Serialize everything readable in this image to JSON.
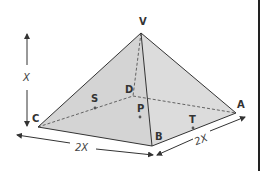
{
  "diagram": {
    "vertices": {
      "apex": {
        "label": "V"
      },
      "front_left": {
        "label": "C"
      },
      "front": {
        "label": "B"
      },
      "right": {
        "label": "A"
      },
      "back": {
        "label": "D"
      }
    },
    "points": {
      "s": {
        "label": "S"
      },
      "p": {
        "label": "P"
      },
      "t": {
        "label": "T"
      }
    },
    "dimensions": {
      "height": "X",
      "base_front": "2X",
      "base_right": "2X"
    },
    "colors": {
      "face_fill": "#d6d6d6",
      "edge": "#333333",
      "background": "#ffffff"
    }
  }
}
